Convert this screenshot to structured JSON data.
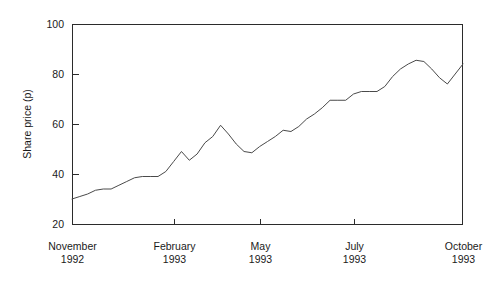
{
  "chart_data": {
    "type": "line",
    "title": "",
    "xlabel": "",
    "ylabel": "Share price (p)",
    "ylim": [
      20,
      100
    ],
    "yticks": [
      20,
      40,
      60,
      80,
      100
    ],
    "ytick_labels": [
      "20",
      "40",
      "60",
      "80",
      "100"
    ],
    "grid": false,
    "legend": false,
    "legend_position": "none",
    "xtick_labels": [
      {
        "month": "November",
        "year": "1992"
      },
      {
        "month": "February",
        "year": "1993"
      },
      {
        "month": "May",
        "year": "1993"
      },
      {
        "month": "July",
        "year": "1993"
      },
      {
        "month": "October",
        "year": "1993"
      }
    ],
    "xtick_positions": [
      0,
      13,
      24,
      36,
      50
    ],
    "xlim": [
      0,
      50
    ],
    "line_color": "#4a4a4a",
    "axis_color": "#2b2b2b",
    "series": [
      {
        "name": "Share price",
        "x": [
          0,
          1,
          2,
          3,
          4,
          5,
          6,
          7,
          8,
          9,
          10,
          11,
          12,
          13,
          14,
          15,
          16,
          17,
          18,
          19,
          20,
          21,
          22,
          23,
          24,
          25,
          26,
          27,
          28,
          29,
          30,
          31,
          32,
          33,
          34,
          35,
          36,
          37,
          38,
          39,
          40,
          41,
          42,
          43,
          44,
          45,
          46,
          47,
          48,
          49,
          50
        ],
        "values": [
          30,
          31,
          32,
          33.5,
          34,
          34,
          35.5,
          37,
          38.5,
          39,
          39,
          39,
          41,
          45,
          49,
          45.5,
          48,
          52.5,
          55,
          59.5,
          56,
          52,
          49,
          48.5,
          51,
          53,
          55,
          57.5,
          57,
          59,
          62,
          64,
          66.5,
          69.5,
          69.5,
          69.5,
          72,
          73,
          73,
          73,
          75,
          79,
          82,
          84,
          85.5,
          85,
          82,
          78.5,
          76,
          80,
          84
        ]
      }
    ]
  },
  "layout": {
    "plot_left": 72,
    "plot_right": 463,
    "plot_top": 24,
    "plot_bottom": 224
  }
}
